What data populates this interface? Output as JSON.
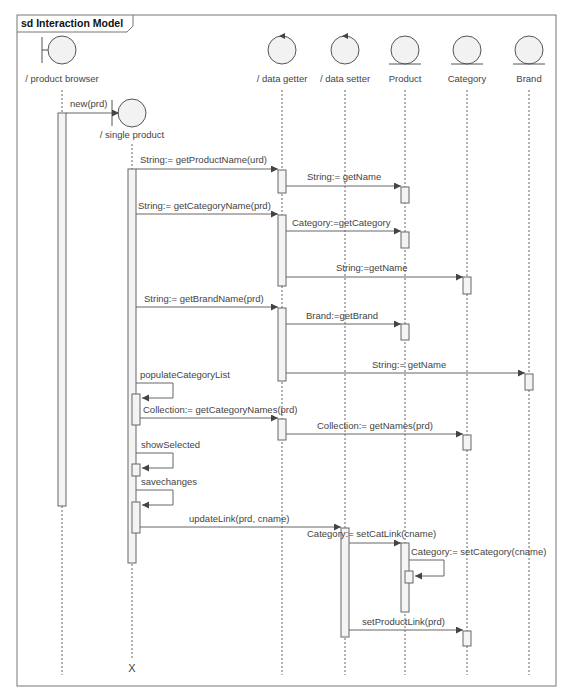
{
  "frame": {
    "title": "sd Interaction Model",
    "x": 17,
    "y": 15,
    "w": 539,
    "h": 671
  },
  "colors": {
    "line": "#666666",
    "activation_fill": "#f4f4f4",
    "object_fill": "#f2f2f2",
    "text": "#444444"
  },
  "lifelines": [
    {
      "id": "product_browser",
      "label": "/ product browser",
      "icon": "boundary-icon",
      "x": 62,
      "cy": 50,
      "label_y": 82,
      "line_top": 90,
      "line_bottom": 675
    },
    {
      "id": "single_product",
      "label": "/ single product",
      "icon": "boundary-icon",
      "x": 132,
      "cy": 113,
      "label_y": 138,
      "line_top": 144,
      "line_bottom": 660,
      "destroyed": true,
      "x_mark": "X",
      "x_y": 672
    },
    {
      "id": "data_getter",
      "label": "/ data getter",
      "icon": "control-icon",
      "x": 282,
      "cy": 50,
      "label_y": 82,
      "line_top": 90,
      "line_bottom": 675
    },
    {
      "id": "data_setter",
      "label": "/ data setter",
      "icon": "control-icon",
      "x": 345,
      "cy": 50,
      "label_y": 82,
      "line_top": 90,
      "line_bottom": 675
    },
    {
      "id": "product",
      "label": "Product",
      "icon": "entity-icon",
      "x": 405,
      "cy": 50,
      "label_y": 82,
      "line_top": 90,
      "line_bottom": 675
    },
    {
      "id": "category",
      "label": "Category",
      "icon": "entity-icon",
      "x": 467,
      "cy": 50,
      "label_y": 82,
      "line_top": 90,
      "line_bottom": 675
    },
    {
      "id": "brand",
      "label": "Brand",
      "icon": "entity-icon",
      "x": 529,
      "cy": 50,
      "label_y": 82,
      "line_top": 90,
      "line_bottom": 675
    }
  ],
  "activations": [
    {
      "lifeline": 0,
      "y1": 113,
      "y2": 506,
      "offset": 0
    },
    {
      "lifeline": 1,
      "y1": 169,
      "y2": 563,
      "offset": 0
    },
    {
      "lifeline": 2,
      "y1": 170,
      "y2": 193,
      "offset": 0
    },
    {
      "lifeline": 4,
      "y1": 187,
      "y2": 203,
      "offset": 0
    },
    {
      "lifeline": 2,
      "y1": 215,
      "y2": 286,
      "offset": 0
    },
    {
      "lifeline": 4,
      "y1": 232,
      "y2": 248,
      "offset": 0
    },
    {
      "lifeline": 5,
      "y1": 277,
      "y2": 294,
      "offset": 0
    },
    {
      "lifeline": 2,
      "y1": 308,
      "y2": 381,
      "offset": 0
    },
    {
      "lifeline": 4,
      "y1": 324,
      "y2": 340,
      "offset": 0
    },
    {
      "lifeline": 6,
      "y1": 374,
      "y2": 390,
      "offset": 0
    },
    {
      "lifeline": 1,
      "y1": 394,
      "y2": 425,
      "offset": 4
    },
    {
      "lifeline": 2,
      "y1": 419,
      "y2": 440,
      "offset": 0
    },
    {
      "lifeline": 5,
      "y1": 435,
      "y2": 450,
      "offset": 0
    },
    {
      "lifeline": 1,
      "y1": 464,
      "y2": 476,
      "offset": 4
    },
    {
      "lifeline": 1,
      "y1": 502,
      "y2": 533,
      "offset": 4
    },
    {
      "lifeline": 3,
      "y1": 528,
      "y2": 637,
      "offset": 0
    },
    {
      "lifeline": 4,
      "y1": 543,
      "y2": 612,
      "offset": 0
    },
    {
      "lifeline": 4,
      "y1": 571,
      "y2": 583,
      "offset": 4
    },
    {
      "lifeline": 5,
      "y1": 631,
      "y2": 646,
      "offset": 0
    }
  ],
  "messages": [
    {
      "label": "new(prd)",
      "from_x": 66,
      "to_x": 119,
      "y": 113,
      "label_x": 70,
      "label_y": 107
    },
    {
      "label": "String:= getProductName(urd)",
      "from_x": 136,
      "to_x": 278,
      "y": 169,
      "label_x": 140,
      "label_y": 163
    },
    {
      "label": "String:= getName",
      "from_x": 286,
      "to_x": 401,
      "y": 186,
      "label_x": 307,
      "label_y": 180
    },
    {
      "label": "String:= getCategoryName(prd)",
      "from_x": 136,
      "to_x": 278,
      "y": 214,
      "label_x": 138,
      "label_y": 209
    },
    {
      "label": "Category:=getCategory",
      "from_x": 286,
      "to_x": 401,
      "y": 231,
      "label_x": 292,
      "label_y": 226
    },
    {
      "label": "String:=getName",
      "from_x": 286,
      "to_x": 463,
      "y": 277,
      "label_x": 336,
      "label_y": 271
    },
    {
      "label": "String:= getBrandName(prd)",
      "from_x": 136,
      "to_x": 278,
      "y": 307,
      "label_x": 144,
      "label_y": 302
    },
    {
      "label": "Brand:=getBrand",
      "from_x": 286,
      "to_x": 401,
      "y": 324,
      "label_x": 306,
      "label_y": 319
    },
    {
      "label": "String:= getName",
      "from_x": 286,
      "to_x": 525,
      "y": 373,
      "label_x": 372,
      "label_y": 368
    },
    {
      "label": "Collection:= getCategoryNames(prd)",
      "from_x": 140,
      "to_x": 278,
      "y": 418,
      "label_x": 143,
      "label_y": 413
    },
    {
      "label": "Collection:= getNames(prd)",
      "from_x": 286,
      "to_x": 463,
      "y": 434,
      "label_x": 317,
      "label_y": 429
    },
    {
      "label": "updateLink(prd, cname)",
      "from_x": 140,
      "to_x": 341,
      "y": 527,
      "label_x": 189,
      "label_y": 522
    },
    {
      "label": "Category:= setCatLink(cname)",
      "from_x": 349,
      "to_x": 401,
      "y": 543,
      "label_x": 307,
      "label_y": 537
    },
    {
      "label": "setProductLink(prd)",
      "from_x": 349,
      "to_x": 463,
      "y": 630,
      "label_x": 362,
      "label_y": 625
    }
  ],
  "self_messages": [
    {
      "label": "populateCategoryList",
      "x": 136,
      "y1": 383,
      "y2": 398,
      "loop_right": 173,
      "label_x": 140,
      "label_y": 378
    },
    {
      "label": "showSelected",
      "x": 136,
      "y1": 453,
      "y2": 468,
      "loop_right": 173,
      "label_x": 141,
      "label_y": 448
    },
    {
      "label": "savechanges",
      "x": 136,
      "y1": 490,
      "y2": 505,
      "loop_right": 173,
      "label_x": 141,
      "label_y": 485
    },
    {
      "label": "Category:= setCategory(cname)",
      "x": 409,
      "y1": 560,
      "y2": 576,
      "loop_right": 444,
      "label_x": 411,
      "label_y": 555
    }
  ]
}
